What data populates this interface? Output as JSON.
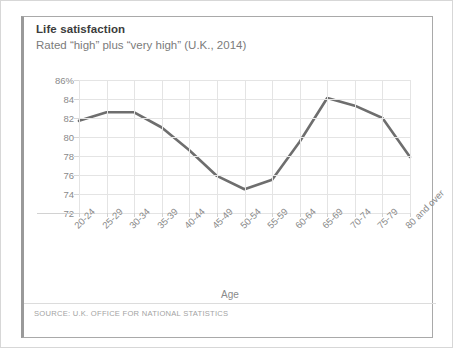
{
  "card": {
    "title": "Life satisfaction",
    "subtitle": "Rated “high” plus “very high” (U.K., 2014)",
    "source": "SOURCE: U.K. OFFICE FOR NATIONAL STATISTICS",
    "accent_color": "#9a9a9a",
    "border_color": "#a9a9a9"
  },
  "chart_data": {
    "type": "line",
    "title": "Life satisfaction",
    "subtitle": "Rated “high” plus “very high” (U.K., 2014)",
    "xlabel": "Age",
    "ylabel": "",
    "categories": [
      "20-24",
      "25-29",
      "30-34",
      "35-39",
      "40-44",
      "45-49",
      "50-54",
      "55-59",
      "60-64",
      "65-69",
      "70-74",
      "75-79",
      "80 and over"
    ],
    "values": [
      81.7,
      82.6,
      82.6,
      81.0,
      78.6,
      75.9,
      74.5,
      75.5,
      79.5,
      84.1,
      83.3,
      82.0,
      77.9
    ],
    "ylim": [
      72,
      86
    ],
    "ytick_labels": [
      "86%",
      "84",
      "82",
      "80",
      "78",
      "76",
      "74",
      "72"
    ],
    "ytick_values": [
      86,
      84,
      82,
      80,
      78,
      76,
      74,
      72
    ],
    "grid": "both",
    "legend": "none",
    "series_color": "#6e6e6e",
    "grid_color": "#e4e4e4",
    "axis_color": "#d2d2d2",
    "tick_label_color": "#8a8a8a"
  }
}
